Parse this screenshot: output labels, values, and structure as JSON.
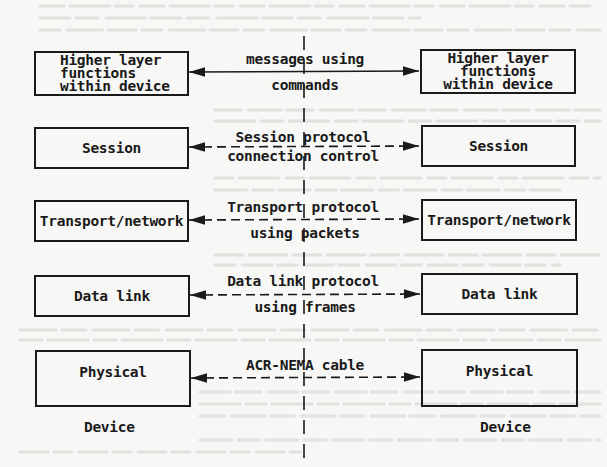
{
  "diagram": {
    "title": "",
    "left_column": {
      "boxes": [
        {
          "id": "higher-layer",
          "lines": [
            "Higher layer",
            "functions",
            "within device"
          ]
        },
        {
          "id": "session",
          "lines": [
            "Session"
          ]
        },
        {
          "id": "transport-network",
          "lines": [
            "Transport/network"
          ]
        },
        {
          "id": "data-link",
          "lines": [
            "Data link"
          ]
        },
        {
          "id": "physical",
          "lines": [
            "Physical"
          ]
        }
      ],
      "device_label": "Device"
    },
    "right_column": {
      "boxes": [
        {
          "id": "higher-layer",
          "lines": [
            "Higher layer",
            "functions",
            "within device"
          ]
        },
        {
          "id": "session",
          "lines": [
            "Session"
          ]
        },
        {
          "id": "transport-network",
          "lines": [
            "Transport/network"
          ]
        },
        {
          "id": "data-link",
          "lines": [
            "Data link"
          ]
        },
        {
          "id": "physical",
          "lines": [
            "Physical"
          ]
        }
      ],
      "device_label": "Device"
    },
    "connections": [
      {
        "level": "higher-layer",
        "style": "solid",
        "label_top": "messages using",
        "label_bottom": "commands"
      },
      {
        "level": "session",
        "style": "dashed",
        "label_top": "Session protocol",
        "label_bottom": "connection control"
      },
      {
        "level": "transport-network",
        "style": "dashed",
        "label_top": "Transport protocol",
        "label_bottom": "using packets"
      },
      {
        "level": "data-link",
        "style": "dashed",
        "label_top": "Data link protocol",
        "label_bottom": "using frames"
      },
      {
        "level": "physical",
        "style": "dashed",
        "label_top": "ACR-NEMA cable",
        "label_bottom": ""
      }
    ],
    "center_divider": {
      "style": "dashed-vertical"
    },
    "colors": {
      "ink": "#1a1a1a",
      "paper": "#f7f7f5",
      "bleed_through": "#d9d9d6"
    }
  }
}
